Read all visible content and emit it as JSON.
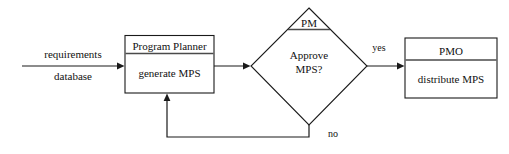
{
  "diagram": {
    "type": "flowchart",
    "background_color": "#ffffff",
    "line_color": "#1a1a1a",
    "text_color": "#111111",
    "divider_color": "#4a4a4a",
    "input_label": {
      "line1": "requirements",
      "line2": "database"
    },
    "process_box": {
      "header": "Program Planner",
      "body": "generate MPS"
    },
    "decision": {
      "header": "PM",
      "body_line1": "Approve",
      "body_line2": "MPS?"
    },
    "branch_labels": {
      "yes": "yes",
      "no": "no"
    },
    "output_box": {
      "header": "PMO",
      "body": "distribute MPS"
    }
  }
}
